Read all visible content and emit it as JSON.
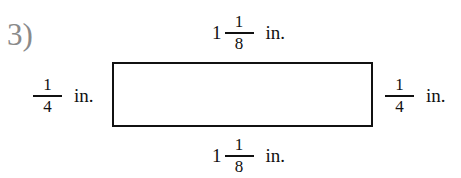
{
  "problem": {
    "number": "3)",
    "shape": "rectangle",
    "colors": {
      "number_text": "#8a8a8a",
      "stroke": "#111111",
      "text": "#111111"
    },
    "sides": {
      "top": {
        "whole": "1",
        "numerator": "1",
        "denominator": "8",
        "unit": "in."
      },
      "bottom": {
        "whole": "1",
        "numerator": "1",
        "denominator": "8",
        "unit": "in."
      },
      "left": {
        "whole": "",
        "numerator": "1",
        "denominator": "4",
        "unit": "in."
      },
      "right": {
        "whole": "",
        "numerator": "1",
        "denominator": "4",
        "unit": "in."
      }
    }
  }
}
